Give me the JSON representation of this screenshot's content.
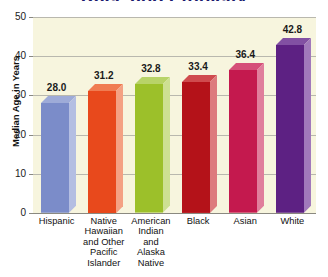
{
  "chart_data": {
    "type": "bar",
    "title": "Race and Ethnicity",
    "subtitle": "",
    "xlabel": "",
    "ylabel": "Median Age in Years",
    "ylim": [
      0,
      50
    ],
    "yticks": [
      "0",
      "10",
      "20",
      "30",
      "40",
      "50"
    ],
    "grid": true,
    "legend": "none",
    "categories": [
      "Hispanic",
      "Native Hawaiian and Other Pacific Islander",
      "American Indian and Alaska Native",
      "Black",
      "Asian",
      "White"
    ],
    "values": [
      28.0,
      31.2,
      32.8,
      33.4,
      36.4,
      42.8
    ],
    "value_labels": [
      "28.0",
      "31.2",
      "32.8",
      "33.4",
      "36.4",
      "42.8"
    ],
    "bar_colors": [
      "#7b8cc9",
      "#e8491c",
      "#9cc02a",
      "#b41219",
      "#c4194e",
      "#5d2183"
    ],
    "bar_top_colors": [
      "#9eabd8",
      "#f07c52",
      "#b8d368",
      "#cf4b4e",
      "#d54f79",
      "#8250a3"
    ],
    "bar_side_colors": [
      "#b4bee2",
      "#f4a183",
      "#cde092",
      "#dd7b7d",
      "#e07e9c",
      "#a179bb"
    ],
    "plot_background": "#f7f5de",
    "grid_color": "#b9b8ae",
    "title_color": "#1b1a6e",
    "category_lines": [
      [
        "Hispanic"
      ],
      [
        "Native",
        "Hawaiian",
        "and Other",
        "Pacific",
        "Islander"
      ],
      [
        "American",
        "Indian",
        "and",
        "Alaska",
        "Native"
      ],
      [
        "Black"
      ],
      [
        "Asian"
      ],
      [
        "White"
      ]
    ]
  }
}
